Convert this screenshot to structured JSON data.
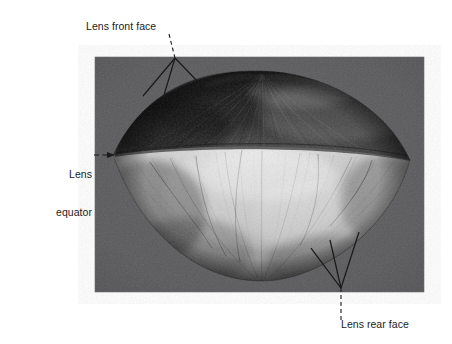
{
  "figure": {
    "kind": "scanning-electron-micrograph",
    "canvas": {
      "width": 452,
      "height": 344,
      "background": "#ffffff"
    },
    "photo": {
      "x": 95,
      "y": 57,
      "width": 329,
      "height": 235,
      "background_color": "#58585a",
      "name": "lens-micrograph-photo"
    },
    "specimen": {
      "shape": "biconvex-lens",
      "left_tip": [
        113,
        155
      ],
      "right_tip": [
        410,
        160
      ],
      "apex_y": 72,
      "base_y": 280,
      "upper_face_color": "#2a2a2a",
      "equator_highlight_color": "#dcdcdc",
      "lower_face_color": "#c2c2c2"
    }
  },
  "annotations": [
    {
      "id": "front-face",
      "name": "label-lens-front-face",
      "text": "Lens front face",
      "leader_style": "dashed-then-fan",
      "leader_color": "#1b1b1b",
      "anchor": [
        175,
        58
      ],
      "targets": [
        [
          143,
          95
        ],
        [
          163,
          101
        ],
        [
          198,
          82
        ]
      ]
    },
    {
      "id": "equator",
      "name": "label-lens-equator",
      "line1": "Lens",
      "line2": "equator",
      "text": "Lens equator",
      "leader_style": "dashed-arrow",
      "leader_color": "#1b1b1b",
      "anchor": [
        95,
        155
      ],
      "targets": [
        [
          114,
          155
        ]
      ]
    },
    {
      "id": "rear-face",
      "name": "label-lens-rear-face",
      "text": "Lens rear face",
      "leader_style": "fan-then-dashed",
      "leader_color": "#1b1b1b",
      "anchor": [
        341,
        288
      ],
      "targets": [
        [
          312,
          248
        ],
        [
          330,
          240
        ],
        [
          358,
          232
        ]
      ]
    }
  ],
  "colors": {
    "page_background": "#ffffff",
    "photo_background": "#58585a",
    "text": "#1b1b1b",
    "leader": "#1b1b1b"
  }
}
